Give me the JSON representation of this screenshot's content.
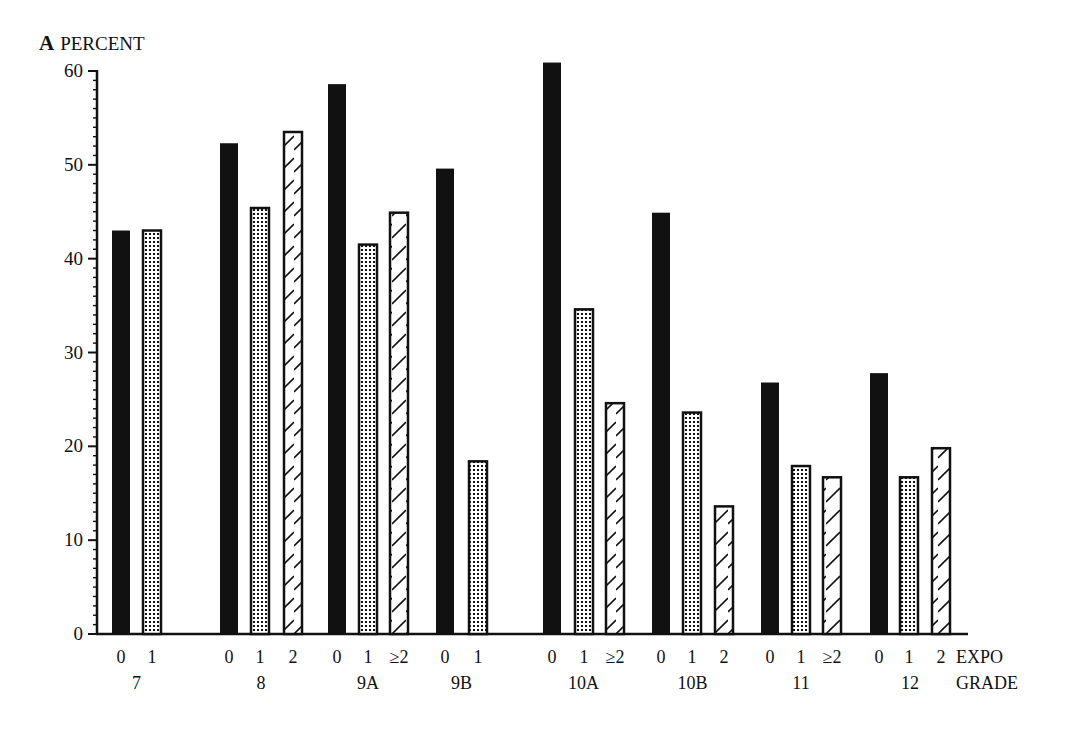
{
  "chart_data": {
    "type": "bar",
    "panel_label": "A",
    "title": "PERCENT",
    "ylabel": "PERCENT",
    "xlabel_rows": [
      "EXPO",
      "GRADE"
    ],
    "ylim": [
      0,
      60
    ],
    "yticks": [
      0,
      10,
      20,
      30,
      40,
      50,
      60
    ],
    "minor_tick_step": 2,
    "grid": false,
    "legend": null,
    "pattern_key": {
      "0": "solid-black",
      "1": "dotted",
      "2": "hatched"
    },
    "groups": [
      {
        "grade": "7",
        "bars": [
          {
            "expo": "0",
            "value": 43.0,
            "pattern": "solid"
          },
          {
            "expo": "1",
            "value": 43.0,
            "pattern": "dotted"
          }
        ]
      },
      {
        "grade": "8",
        "bars": [
          {
            "expo": "0",
            "value": 52.3,
            "pattern": "solid"
          },
          {
            "expo": "1",
            "value": 45.4,
            "pattern": "dotted"
          },
          {
            "expo": "2",
            "value": 53.5,
            "pattern": "hatched"
          }
        ]
      },
      {
        "grade": "9A",
        "bars": [
          {
            "expo": "0",
            "value": 58.6,
            "pattern": "solid"
          },
          {
            "expo": "1",
            "value": 41.5,
            "pattern": "dotted"
          },
          {
            "expo": "≥2",
            "value": 44.9,
            "pattern": "hatched"
          }
        ]
      },
      {
        "grade": "9B",
        "bars": [
          {
            "expo": "0",
            "value": 49.6,
            "pattern": "solid"
          },
          {
            "expo": "1",
            "value": 18.4,
            "pattern": "dotted"
          }
        ]
      },
      {
        "grade": "10A",
        "bars": [
          {
            "expo": "0",
            "value": 60.9,
            "pattern": "solid"
          },
          {
            "expo": "1",
            "value": 34.6,
            "pattern": "dotted"
          },
          {
            "expo": "≥2",
            "value": 24.6,
            "pattern": "hatched"
          }
        ]
      },
      {
        "grade": "10B",
        "bars": [
          {
            "expo": "0",
            "value": 44.9,
            "pattern": "solid"
          },
          {
            "expo": "1",
            "value": 23.6,
            "pattern": "dotted"
          },
          {
            "expo": "2",
            "value": 13.6,
            "pattern": "hatched"
          }
        ]
      },
      {
        "grade": "11",
        "bars": [
          {
            "expo": "0",
            "value": 26.8,
            "pattern": "solid"
          },
          {
            "expo": "1",
            "value": 17.9,
            "pattern": "dotted"
          },
          {
            "expo": "≥2",
            "value": 16.7,
            "pattern": "hatched"
          }
        ]
      },
      {
        "grade": "12",
        "bars": [
          {
            "expo": "0",
            "value": 27.8,
            "pattern": "solid"
          },
          {
            "expo": "1",
            "value": 16.7,
            "pattern": "dotted"
          },
          {
            "expo": "2",
            "value": 19.8,
            "pattern": "hatched"
          }
        ]
      }
    ]
  },
  "layout": {
    "bar_x": [
      [
        112,
        143
      ],
      [
        220,
        251,
        284
      ],
      [
        328,
        359,
        390
      ],
      [
        436,
        469
      ],
      [
        543,
        575,
        606
      ],
      [
        652,
        683,
        715
      ],
      [
        761,
        792,
        823
      ],
      [
        870,
        900,
        932
      ]
    ],
    "bar_width": 18
  },
  "colors": {
    "ink": "#111111",
    "background": "#ffffff"
  }
}
